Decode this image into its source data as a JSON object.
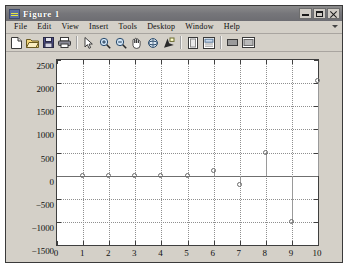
{
  "window": {
    "title": "Figure 1",
    "icon": "matlab-figure-icon",
    "buttons": [
      {
        "name": "minimize",
        "label": "Minimize"
      },
      {
        "name": "maximize",
        "label": "Maximize"
      },
      {
        "name": "close",
        "label": "Close"
      }
    ]
  },
  "menu": {
    "items": [
      "File",
      "Edit",
      "View",
      "Insert",
      "Tools",
      "Desktop",
      "Window",
      "Help"
    ],
    "overflow": "more-menu-arrow"
  },
  "toolbar": {
    "groups": [
      [
        {
          "name": "new-figure-icon",
          "tip": "New Figure"
        },
        {
          "name": "open-file-icon",
          "tip": "Open File"
        },
        {
          "name": "save-figure-icon",
          "tip": "Save Figure"
        },
        {
          "name": "print-figure-icon",
          "tip": "Print Figure"
        }
      ],
      [
        {
          "name": "edit-plot-arrow-icon",
          "tip": "Edit Plot"
        },
        {
          "name": "zoom-in-icon",
          "tip": "Zoom In"
        },
        {
          "name": "zoom-out-icon",
          "tip": "Zoom Out"
        },
        {
          "name": "pan-hand-icon",
          "tip": "Pan"
        },
        {
          "name": "rotate-3d-icon",
          "tip": "Rotate 3D"
        },
        {
          "name": "data-cursor-icon",
          "tip": "Data Cursor"
        }
      ],
      [
        {
          "name": "insert-colorbar-icon",
          "tip": "Insert Colorbar"
        },
        {
          "name": "insert-legend-icon",
          "tip": "Insert Legend"
        }
      ],
      [
        {
          "name": "hide-plot-tools-icon",
          "tip": "Hide Plot Tools"
        },
        {
          "name": "show-plot-tools-icon",
          "tip": "Show Plot Tools"
        }
      ]
    ]
  },
  "chart_data": {
    "type": "scatter",
    "title": "",
    "xlabel": "",
    "ylabel": "",
    "xlim": [
      0,
      10
    ],
    "ylim": [
      -1500,
      2500
    ],
    "xticks": [
      0,
      1,
      2,
      3,
      4,
      5,
      6,
      7,
      8,
      9,
      10
    ],
    "yticks": [
      -1500,
      -1000,
      -500,
      0,
      500,
      1000,
      1500,
      2000,
      2500
    ],
    "grid": true,
    "legend": null,
    "marker": "circle-open",
    "marker_color": "#6b6b6b",
    "baseline": 0,
    "x": [
      1,
      2,
      3,
      4,
      5,
      6,
      7,
      8,
      9,
      10
    ],
    "y": [
      0,
      0,
      0,
      0,
      0,
      100,
      -200,
      500,
      -1000,
      2050
    ]
  },
  "colors": {
    "window_face": "#d4d0c8",
    "titlebar": "#76767a",
    "titlebar_text": "#ffffff",
    "axes_background": "#ffffff",
    "axes_border": "#3f3f3f",
    "grid": "#8f8f8f",
    "marker": "#6b6b6b"
  }
}
